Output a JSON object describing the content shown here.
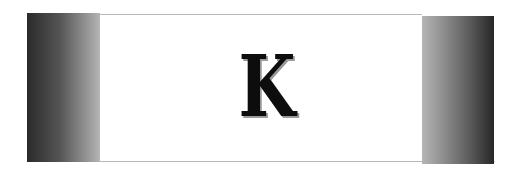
{
  "letter": "K",
  "colors": {
    "background": "#ffffff",
    "letter": "#0d0d0d",
    "letter_shadow": "#9a9a9a",
    "block_dark": "#262626",
    "block_light": "#b5b5b5",
    "rule": "#b8b8b8"
  }
}
